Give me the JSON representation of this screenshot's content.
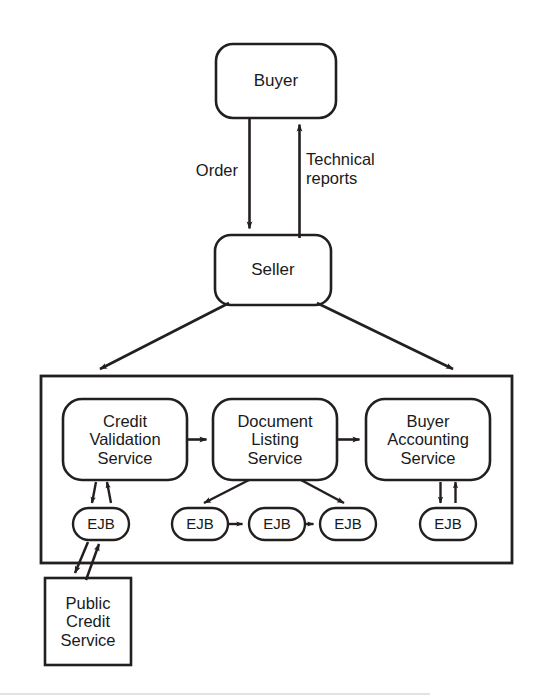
{
  "diagram": {
    "stroke_color": "#231f20",
    "background_color": "#ffffff",
    "actors": {
      "buyer": {
        "label": "Buyer",
        "shape": "rounded-rectangle",
        "x": 216,
        "y": 44,
        "w": 120,
        "h": 74
      },
      "seller": {
        "label": "Seller",
        "shape": "rounded-rectangle",
        "x": 215,
        "y": 235,
        "w": 116,
        "h": 70
      }
    },
    "edge_labels": {
      "order": "Order",
      "technical_reports": "Technical\nreports"
    },
    "container": {
      "name": "service-container",
      "shape": "rectangle",
      "x": 41,
      "y": 376,
      "w": 471,
      "h": 187
    },
    "services": [
      {
        "id": "credit-validation-service",
        "label": "Credit\nValidation\nService",
        "shape": "rounded-rectangle",
        "x": 63,
        "y": 399,
        "w": 124,
        "h": 81
      },
      {
        "id": "document-listing-service",
        "label": "Document\nListing\nService",
        "shape": "rounded-rectangle",
        "x": 213,
        "y": 399,
        "w": 124,
        "h": 81
      },
      {
        "id": "buyer-accounting-service",
        "label": "Buyer\nAccounting\nService",
        "shape": "rounded-rectangle",
        "x": 366,
        "y": 399,
        "w": 124,
        "h": 81
      }
    ],
    "ejb_nodes": [
      {
        "id": "ejb-credit-validation",
        "label": "EJB",
        "shape": "stadium",
        "x": 73,
        "y": 508,
        "w": 56,
        "h": 32,
        "parent": "credit-validation-service"
      },
      {
        "id": "ejb-document-listing-1",
        "label": "EJB",
        "shape": "stadium",
        "x": 172,
        "y": 508,
        "w": 56,
        "h": 32,
        "parent": "document-listing-service"
      },
      {
        "id": "ejb-document-listing-2",
        "label": "EJB",
        "shape": "stadium",
        "x": 249,
        "y": 508,
        "w": 56,
        "h": 32,
        "parent": "document-listing-service"
      },
      {
        "id": "ejb-document-listing-3",
        "label": "EJB",
        "shape": "stadium",
        "x": 320,
        "y": 508,
        "w": 56,
        "h": 32,
        "parent": "document-listing-service"
      },
      {
        "id": "ejb-buyer-accounting",
        "label": "EJB",
        "shape": "stadium",
        "x": 420,
        "y": 508,
        "w": 56,
        "h": 32,
        "parent": "buyer-accounting-service"
      }
    ],
    "external": {
      "public_credit_service": {
        "id": "public-credit-service",
        "label": "Public\nCredit\nService",
        "shape": "rectangle",
        "x": 45,
        "y": 578,
        "w": 86,
        "h": 87
      }
    },
    "connections": [
      {
        "from": "buyer",
        "to": "seller",
        "label": "Order",
        "direction": "down"
      },
      {
        "from": "seller",
        "to": "buyer",
        "label": "Technical reports",
        "direction": "up"
      },
      {
        "from": "seller",
        "to": "service-container",
        "label": "",
        "direction": "down-left"
      },
      {
        "from": "seller",
        "to": "service-container",
        "label": "",
        "direction": "down-right"
      },
      {
        "from": "credit-validation-service",
        "to": "document-listing-service",
        "label": "",
        "direction": "right"
      },
      {
        "from": "document-listing-service",
        "to": "buyer-accounting-service",
        "label": "",
        "direction": "right"
      },
      {
        "from": "credit-validation-service",
        "to": "ejb-credit-validation",
        "label": "",
        "direction": "bidirectional"
      },
      {
        "from": "document-listing-service",
        "to": "ejb-document-listing-1",
        "label": "",
        "direction": "down-left"
      },
      {
        "from": "document-listing-service",
        "to": "ejb-document-listing-3",
        "label": "",
        "direction": "down-right"
      },
      {
        "from": "ejb-document-listing-1",
        "to": "ejb-document-listing-2",
        "label": "",
        "direction": "right"
      },
      {
        "from": "ejb-document-listing-2",
        "to": "ejb-document-listing-3",
        "label": "",
        "direction": "right"
      },
      {
        "from": "buyer-accounting-service",
        "to": "ejb-buyer-accounting",
        "label": "",
        "direction": "bidirectional"
      },
      {
        "from": "ejb-credit-validation",
        "to": "public-credit-service",
        "label": "",
        "direction": "bidirectional"
      }
    ]
  }
}
